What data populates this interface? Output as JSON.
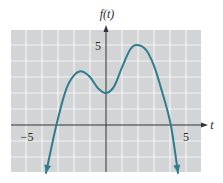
{
  "chart_data": {
    "type": "line",
    "title": "",
    "xlabel": "t",
    "ylabel": "f(t)",
    "xlim": [
      -6,
      6
    ],
    "ylim": [
      -3,
      6
    ],
    "grid": true,
    "x_tick_labels": [
      {
        "value": -5,
        "label": "−5"
      },
      {
        "value": 5,
        "label": "5"
      }
    ],
    "y_tick_labels": [
      {
        "value": 5,
        "label": "5"
      }
    ],
    "series": [
      {
        "name": "f(t)",
        "color": "#2e7d8c",
        "arrows_at_ends": true,
        "points": [
          [
            -3.75,
            -3.0
          ],
          [
            -3.1,
            0.0
          ],
          [
            -2.5,
            2.2
          ],
          [
            -2.0,
            3.1
          ],
          [
            -1.5,
            3.35
          ],
          [
            -1.0,
            3.0
          ],
          [
            -0.5,
            2.3
          ],
          [
            0.0,
            2.0
          ],
          [
            0.5,
            2.4
          ],
          [
            1.0,
            3.6
          ],
          [
            1.5,
            4.7
          ],
          [
            1.9,
            5.0
          ],
          [
            2.5,
            4.7
          ],
          [
            3.0,
            3.7
          ],
          [
            3.5,
            2.1
          ],
          [
            4.05,
            0.0
          ],
          [
            4.5,
            -3.0
          ]
        ]
      }
    ],
    "features": {
      "x_intercepts": [
        -3.1,
        4.05
      ],
      "y_intercept": 2.0,
      "local_maxima": [
        [
          -1.5,
          3.35
        ],
        [
          1.9,
          5.0
        ]
      ],
      "local_minima": [
        [
          0.0,
          2.0
        ]
      ]
    }
  },
  "colors": {
    "grid_background": "#d3d4d6",
    "grid_lines": "#f4f4f4",
    "axis": "#333333",
    "curve": "#2e7d8c"
  },
  "labels": {
    "y_axis": "f(t)",
    "x_axis": "t",
    "x_neg": "−5",
    "x_pos": "5",
    "y_pos": "5"
  }
}
